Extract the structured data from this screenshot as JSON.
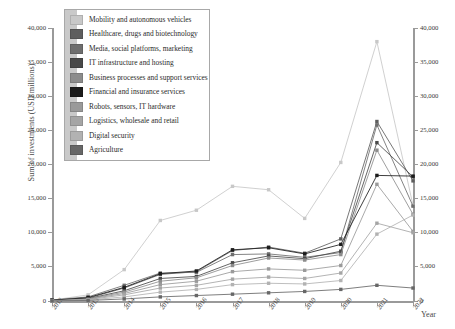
{
  "chart_data": {
    "type": "line",
    "title": "",
    "xlabel": "Year",
    "ylabel": "Sum of investments (USD millions)",
    "ylabel_right": "Sum of investments (USD millions)",
    "categories": [
      "2012",
      "2013",
      "2014",
      "2015",
      "2016",
      "2017",
      "2018",
      "2019",
      "2020",
      "2021",
      "2022"
    ],
    "x": [
      2012,
      2013,
      2014,
      2015,
      2016,
      2017,
      2018,
      2019,
      2020,
      2021,
      2022
    ],
    "ylim": [
      0,
      40000
    ],
    "ytick_labels": [
      "0",
      "5,000",
      "10,000",
      "15,000",
      "20,000",
      "25,000",
      "30,000",
      "35,000",
      "40,000"
    ],
    "ytick_values": [
      0,
      5000,
      10000,
      15000,
      20000,
      25000,
      30000,
      35000,
      40000
    ],
    "ytick_labels_right": [
      "0",
      "5,000",
      "10,000",
      "15,000",
      "20,000",
      "25,000",
      "30,000",
      "35,000",
      "40,000"
    ],
    "grid": false,
    "legend_position": "upper-left-inside",
    "markers": "square",
    "series": [
      {
        "name": "Mobility and autonomous vehicles",
        "color": "#c8c8c8",
        "values": [
          120,
          900,
          4600,
          11800,
          13300,
          16800,
          16300,
          12100,
          20300,
          38000,
          14000
        ]
      },
      {
        "name": "Healthcare, drugs and biotechnology",
        "color": "#5e5e5e",
        "values": [
          90,
          420,
          1900,
          3900,
          4300,
          7400,
          7900,
          7000,
          9100,
          26300,
          17600
        ]
      },
      {
        "name": "Media, social platforms, marketing",
        "color": "#6e6e6e",
        "values": [
          150,
          600,
          2300,
          4100,
          4200,
          6800,
          6900,
          6400,
          7100,
          25800,
          13900
        ]
      },
      {
        "name": "IT infrastructure and hosting",
        "color": "#494949",
        "values": [
          70,
          350,
          1500,
          3300,
          3600,
          5600,
          6600,
          6200,
          7300,
          23200,
          18200
        ]
      },
      {
        "name": "Business processes and support services",
        "color": "#8c8c8c",
        "values": [
          60,
          300,
          1300,
          2900,
          3400,
          5200,
          6300,
          6000,
          6800,
          22100,
          12700
        ]
      },
      {
        "name": "Financial and insurance services",
        "color": "#1c1c1c",
        "values": [
          110,
          500,
          2000,
          4000,
          4400,
          7500,
          7800,
          6900,
          8300,
          18400,
          18300
        ]
      },
      {
        "name": "Robots, sensors, IT hardware",
        "color": "#9a9a9a",
        "values": [
          50,
          260,
          1100,
          2400,
          2900,
          4300,
          4700,
          4500,
          5200,
          17100,
          10200
        ]
      },
      {
        "name": "Logistics, wholesale and retail",
        "color": "#a5a5a5",
        "values": [
          40,
          200,
          900,
          1900,
          2300,
          3200,
          3500,
          3300,
          4100,
          11400,
          10000
        ]
      },
      {
        "name": "Digital security",
        "color": "#b2b2b2",
        "values": [
          30,
          150,
          600,
          1300,
          1700,
          2400,
          2600,
          2500,
          3000,
          9800,
          12600
        ]
      },
      {
        "name": "Agriculture",
        "color": "#676767",
        "values": [
          20,
          80,
          300,
          600,
          800,
          1000,
          1200,
          1400,
          1700,
          2300,
          1900
        ]
      }
    ]
  },
  "legend": {
    "items": [
      {
        "label": "Mobility and autonomous vehicles",
        "color": "#c8c8c8"
      },
      {
        "label": "Healthcare, drugs and biotechnology",
        "color": "#5e5e5e"
      },
      {
        "label": "Media, social platforms, marketing",
        "color": "#6e6e6e"
      },
      {
        "label": "IT infrastructure and hosting",
        "color": "#494949"
      },
      {
        "label": "Business processes and support services",
        "color": "#8c8c8c"
      },
      {
        "label": "Financial and insurance services",
        "color": "#1c1c1c"
      },
      {
        "label": "Robots, sensors, IT hardware",
        "color": "#9a9a9a"
      },
      {
        "label": "Logistics, wholesale and retail",
        "color": "#a5a5a5"
      },
      {
        "label": "Digital security",
        "color": "#b2b2b2"
      },
      {
        "label": "Agriculture",
        "color": "#676767"
      }
    ]
  }
}
